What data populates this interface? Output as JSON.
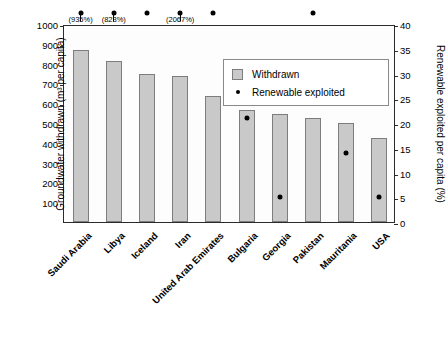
{
  "chart_data": {
    "type": "bar",
    "title": "",
    "categories": [
      "Saudi Arabia",
      "Libya",
      "Iceland",
      "Iran",
      "United Arab Emirates",
      "Bulgaria",
      "Georgia",
      "Pakistan",
      "Mauritania",
      "USA"
    ],
    "series": [
      {
        "name": "Withdrawn",
        "axis": "left",
        "values": [
          870,
          812,
          748,
          735,
          637,
          565,
          545,
          525,
          498,
          425
        ]
      },
      {
        "name": "Renewable exploited",
        "axis": "right",
        "values": [
          null,
          null,
          null,
          null,
          null,
          21,
          5,
          null,
          14,
          5
        ],
        "offscale_above_top": [
          true,
          true,
          true,
          true,
          true,
          false,
          false,
          true,
          false,
          false
        ],
        "labels": [
          "(935%)",
          "(823%)",
          "",
          "(2067%)",
          "",
          "",
          "",
          "",
          "",
          ""
        ]
      }
    ],
    "ylabel": "Groundwater withdrawn (m³ per capita)",
    "ylabel_right": "Renewable exploited per capita (%)",
    "xlabel": "",
    "ylim": [
      0,
      1000
    ],
    "ylim_right": [
      0,
      40
    ],
    "yticks": [
      "1000",
      "900",
      "800",
      "700",
      "600",
      "500",
      "400",
      "300",
      "200",
      "100"
    ],
    "yticks_right": [
      "40",
      "35",
      "30",
      "25",
      "20",
      "15",
      "10",
      "5",
      "0"
    ],
    "grid": false,
    "legend_position": "upper right"
  },
  "legend": {
    "items": [
      {
        "label": "Withdrawn",
        "marker": "square-swatch"
      },
      {
        "label": "Renewable exploited",
        "marker": "dot"
      }
    ]
  }
}
